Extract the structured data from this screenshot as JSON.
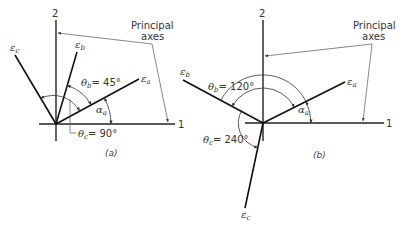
{
  "panel_a": {
    "caption": "(a)",
    "axis_vertical_label": "2",
    "axis_horizontal_label": "1",
    "principal_axes_label_line1": "Principal",
    "principal_axes_label_line2": "axes",
    "vectors": [
      {
        "name": "epsilon-a",
        "symbol": "ε",
        "subscript": "a"
      },
      {
        "name": "epsilon-b",
        "symbol": "ε",
        "subscript": "b"
      },
      {
        "name": "epsilon-c",
        "symbol": "ε",
        "subscript": "c"
      }
    ],
    "theta_b": {
      "symbol": "θ",
      "subscript": "b",
      "value": "= 45°"
    },
    "theta_c": {
      "symbol": "θ",
      "subscript": "c",
      "value": "= 90°"
    },
    "alpha_a": {
      "symbol": "α",
      "subscript": "a"
    }
  },
  "panel_b": {
    "caption": "(b)",
    "axis_vertical_label": "2",
    "axis_horizontal_label": "1",
    "principal_axes_label_line1": "Principal",
    "principal_axes_label_line2": "axes",
    "vectors": [
      {
        "name": "epsilon-a",
        "symbol": "ε",
        "subscript": "a"
      },
      {
        "name": "epsilon-b",
        "symbol": "ε",
        "subscript": "b"
      },
      {
        "name": "epsilon-c",
        "symbol": "ε",
        "subscript": "c"
      }
    ],
    "theta_b": {
      "symbol": "θ",
      "subscript": "b",
      "value": "= 120°"
    },
    "theta_c": {
      "symbol": "θ",
      "subscript": "c",
      "value": "= 240°"
    },
    "alpha_a": {
      "symbol": "α",
      "subscript": "a"
    }
  }
}
